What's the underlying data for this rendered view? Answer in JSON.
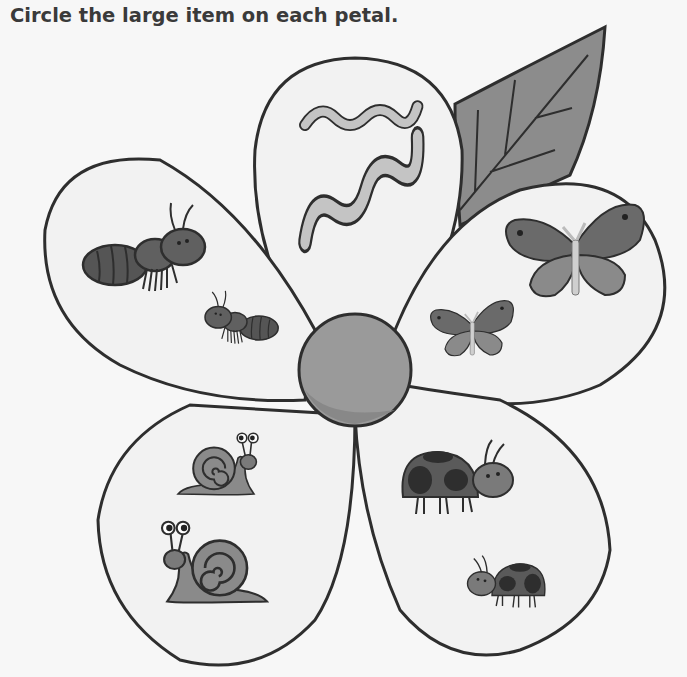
{
  "worksheet": {
    "instruction": "Circle the large item on each petal."
  },
  "colors": {
    "background": "#f7f7f7",
    "outline": "#2e2e2e",
    "petal_fill": "#f2f2f2",
    "center_fill": "#9a9a9a",
    "leaf_fill": "#8c8c8c"
  },
  "flower": {
    "center": "flower-center",
    "leaf": "leaf",
    "petals": [
      {
        "position": "top",
        "item": "worm",
        "items": [
          "small worm",
          "large worm"
        ]
      },
      {
        "position": "right",
        "item": "butterfly",
        "items": [
          "large butterfly",
          "small butterfly"
        ]
      },
      {
        "position": "left",
        "item": "ant",
        "items": [
          "large ant",
          "small ant"
        ]
      },
      {
        "position": "bottom-left",
        "item": "snail",
        "items": [
          "small snail",
          "large snail"
        ]
      },
      {
        "position": "bottom-right",
        "item": "ladybug",
        "items": [
          "large ladybug",
          "small ladybug"
        ]
      }
    ]
  }
}
